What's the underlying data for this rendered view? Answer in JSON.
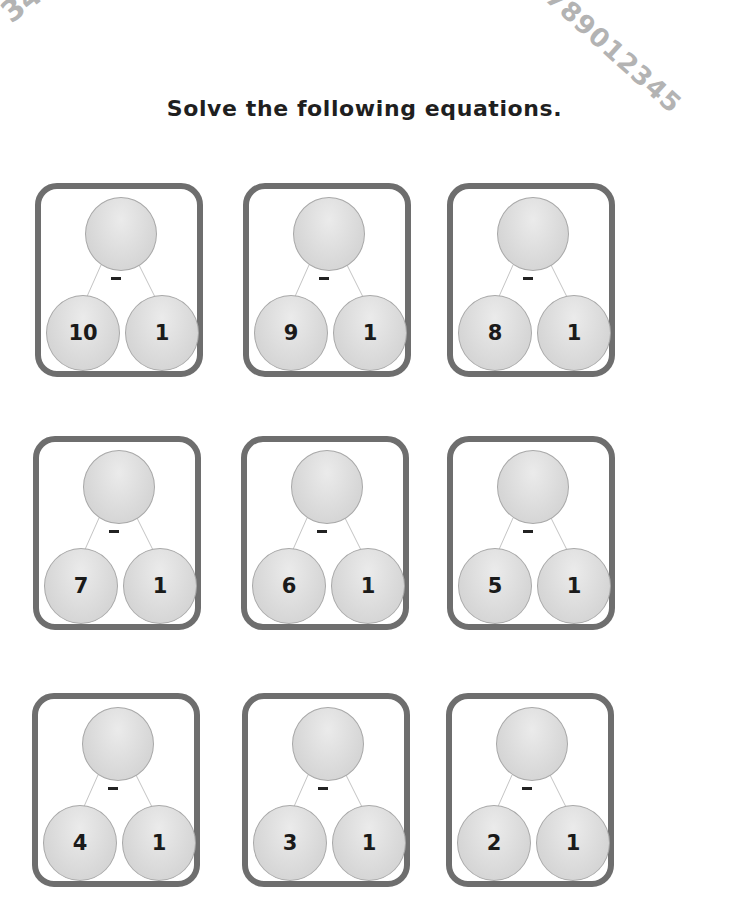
{
  "decoration": {
    "top_left_digits": "345",
    "top_right_digits": "789012345"
  },
  "worksheet": {
    "title": "Solve the following equations.",
    "operator": "-",
    "problems": [
      {
        "top": "",
        "left": "10",
        "right": "1"
      },
      {
        "top": "",
        "left": "9",
        "right": "1"
      },
      {
        "top": "",
        "left": "8",
        "right": "1"
      },
      {
        "top": "",
        "left": "7",
        "right": "1"
      },
      {
        "top": "",
        "left": "6",
        "right": "1"
      },
      {
        "top": "",
        "left": "5",
        "right": "1"
      },
      {
        "top": "",
        "left": "4",
        "right": "1"
      },
      {
        "top": "",
        "left": "3",
        "right": "1"
      },
      {
        "top": "",
        "left": "2",
        "right": "1"
      }
    ]
  },
  "colors": {
    "box_border": "#6e6e6e",
    "circle_fill": "#d9d9d9",
    "text": "#1a1a1a"
  }
}
